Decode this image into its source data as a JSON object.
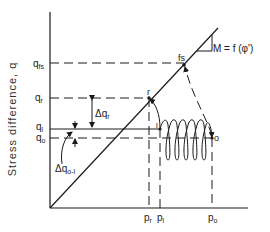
{
  "figure": {
    "y_axis_label": "Stress difference, q",
    "slope_annotation": "M = f (φ')",
    "y_ticks": [
      {
        "label": "q",
        "sub": "fs",
        "y": 63
      },
      {
        "label": "q",
        "sub": "r",
        "y": 98
      },
      {
        "label": "q",
        "sub": "l",
        "y": 129
      },
      {
        "label": "q",
        "sub": "o",
        "y": 138
      }
    ],
    "x_ticks": [
      {
        "label": "p",
        "sub": "r",
        "x": 149
      },
      {
        "label": "p",
        "sub": "l",
        "x": 160
      },
      {
        "label": "p",
        "sub": "o",
        "x": 212
      }
    ],
    "points": {
      "fs": "fs",
      "r": "r",
      "l": "l",
      "o": "o"
    },
    "delta_labels": {
      "delta_qr": "Δq",
      "delta_qr_sub": "r",
      "delta_qol": "Δq",
      "delta_qol_sub": "o-l"
    }
  }
}
